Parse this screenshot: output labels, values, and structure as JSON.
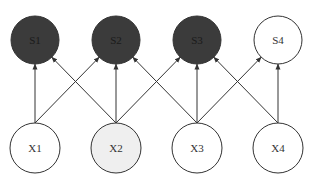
{
  "diagram": {
    "type": "graphical-model",
    "colors": {
      "observed_dark": "#3b3b3b",
      "highlight_light": "#efefef",
      "open": "#ffffff",
      "stroke": "#333333",
      "edge": "#333333"
    },
    "top_nodes": [
      {
        "id": "S1",
        "label": "S1",
        "cx": 35,
        "cy": 40,
        "r": 24,
        "fill": "observed_dark"
      },
      {
        "id": "S2",
        "label": "S2",
        "cx": 116,
        "cy": 40,
        "r": 24,
        "fill": "observed_dark"
      },
      {
        "id": "S3",
        "label": "S3",
        "cx": 197,
        "cy": 40,
        "r": 24,
        "fill": "observed_dark"
      },
      {
        "id": "S4",
        "label": "S4",
        "cx": 278,
        "cy": 40,
        "r": 24,
        "fill": "open"
      }
    ],
    "bottom_nodes": [
      {
        "id": "X1",
        "label": "X1",
        "cx": 35,
        "cy": 148,
        "r": 25,
        "fill": "open"
      },
      {
        "id": "X2",
        "label": "X2",
        "cx": 116,
        "cy": 148,
        "r": 25,
        "fill": "highlight_light"
      },
      {
        "id": "X3",
        "label": "X3",
        "cx": 197,
        "cy": 148,
        "r": 25,
        "fill": "open"
      },
      {
        "id": "X4",
        "label": "X4",
        "cx": 278,
        "cy": 148,
        "r": 25,
        "fill": "open"
      }
    ],
    "edges": [
      {
        "from": "X1",
        "to": "S1"
      },
      {
        "from": "X1",
        "to": "S2"
      },
      {
        "from": "X2",
        "to": "S1"
      },
      {
        "from": "X2",
        "to": "S2"
      },
      {
        "from": "X2",
        "to": "S3"
      },
      {
        "from": "X3",
        "to": "S2"
      },
      {
        "from": "X3",
        "to": "S3"
      },
      {
        "from": "X3",
        "to": "S4"
      },
      {
        "from": "X4",
        "to": "S3"
      },
      {
        "from": "X4",
        "to": "S4"
      }
    ]
  }
}
